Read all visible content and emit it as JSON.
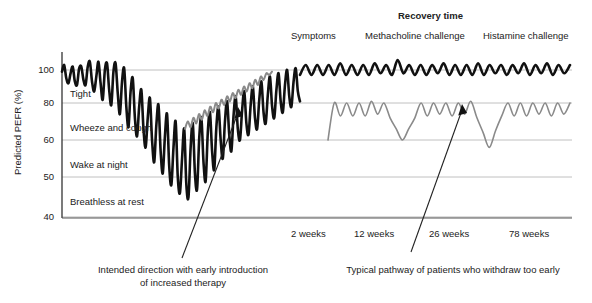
{
  "chart_data": {
    "type": "line",
    "title": "",
    "ylabel": "Predicted PEFR (%)",
    "xlabel": "",
    "ylim": [
      40,
      110
    ],
    "yticks": [
      100,
      80,
      60,
      50,
      40
    ],
    "ytick_labels": [
      "100",
      "80",
      "60",
      "50",
      "40"
    ],
    "grid": true,
    "gridlines_at": [
      100,
      80,
      60,
      50,
      40
    ],
    "xtick_labels": [
      "2 weeks",
      "12 weeks",
      "26 weeks",
      "78 weeks"
    ],
    "xtick_positions_px": [
      308,
      375,
      450,
      530
    ],
    "zone_labels": [
      {
        "text": "Tight",
        "value_band": [
          80,
          100
        ]
      },
      {
        "text": "Wheeze and cough",
        "value_band": [
          60,
          80
        ]
      },
      {
        "text": "Wake at night",
        "value_band": [
          50,
          60
        ]
      },
      {
        "text": "Breathless at rest",
        "value_band": [
          40,
          50
        ]
      }
    ],
    "header_labels": [
      {
        "text": "Recovery time",
        "bold": true
      },
      {
        "text": "Symptoms",
        "bold": false
      },
      {
        "text": "Methacholine challenge",
        "bold": false
      },
      {
        "text": "Histamine challenge",
        "bold": false
      }
    ],
    "annotations": [
      {
        "text_lines": [
          "Intended direction with early introduction",
          "of increased therapy"
        ],
        "points_to": "gray recovery curve",
        "arrow": true
      },
      {
        "text_lines": [
          "Typical pathway of patients who withdraw too early"
        ],
        "points_to": "gray suboptimal plateau curve",
        "arrow": true
      }
    ],
    "series": [
      {
        "name": "Deteriorating / relapsing pathway (black)",
        "color": "#111111",
        "linewidth": 2.6,
        "values": [
          99,
          103,
          95,
          92,
          98,
          102,
          93,
          91,
          101,
          102,
          94,
          91,
          102,
          105,
          93,
          87,
          96,
          105,
          92,
          82,
          100,
          104,
          88,
          79,
          99,
          104,
          86,
          74,
          93,
          101,
          78,
          67,
          87,
          95,
          72,
          62,
          78,
          88,
          66,
          58,
          72,
          83,
          60,
          54,
          68,
          79,
          57,
          51,
          62,
          74,
          53,
          48,
          58,
          70,
          50,
          46,
          55,
          66,
          48,
          45,
          58,
          69,
          51,
          47,
          61,
          72,
          54,
          49,
          64,
          75,
          57,
          52,
          67,
          78,
          60,
          55,
          70,
          81,
          63,
          57,
          73,
          84,
          66,
          60,
          76,
          87,
          69,
          63,
          79,
          90,
          72,
          66,
          82,
          93,
          75,
          69,
          85,
          96,
          78,
          72,
          88,
          98,
          81,
          75,
          91,
          100,
          84,
          78,
          93,
          101,
          87,
          81
        ]
      },
      {
        "name": "Intended recovery pathway with early therapy (grey, rising)",
        "color": "#8a8a8a",
        "linewidth": 2.0,
        "values": [
          66,
          70,
          67,
          72,
          69,
          74,
          71,
          76,
          73,
          78,
          75,
          80,
          77,
          82,
          79,
          84,
          81,
          86,
          83,
          88,
          85,
          90,
          87,
          92,
          89,
          94,
          91,
          96,
          94,
          98,
          97,
          99
        ]
      },
      {
        "name": "Typical pathway of patients who withdraw too early (grey plateau)",
        "color": "#8a8a8a",
        "linewidth": 1.6,
        "values": [
          60,
          80,
          73,
          80,
          73,
          80,
          73,
          81,
          74,
          80,
          72,
          66,
          60,
          66,
          72,
          80,
          73,
          80,
          74,
          80,
          73,
          80,
          74,
          81,
          72,
          64,
          58,
          65,
          73,
          80,
          73,
          80,
          73,
          80,
          74,
          80,
          73,
          80,
          74,
          80
        ]
      },
      {
        "name": "Sustained control pathway (black, upper oscillation)",
        "color": "#111111",
        "linewidth": 2.6,
        "values": [
          97,
          103,
          97,
          103,
          97,
          103,
          97,
          104,
          97,
          103,
          97,
          103,
          97,
          104,
          98,
          103,
          97,
          106,
          98,
          103,
          97,
          103,
          97,
          103,
          98,
          104,
          97,
          103,
          97,
          103,
          97,
          104,
          97,
          103,
          98,
          103,
          97,
          103,
          98,
          104,
          97,
          103,
          98,
          104,
          97,
          103,
          98,
          103
        ]
      }
    ]
  },
  "axis": {
    "y_title": "Predicted PEFR (%)"
  }
}
